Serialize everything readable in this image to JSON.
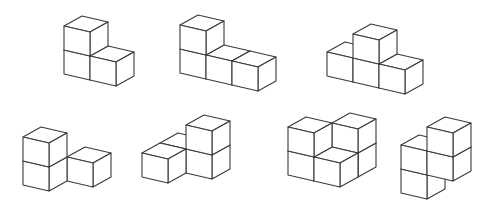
{
  "diagram": {
    "style": {
      "stroke": "#3a3a3a",
      "fill": "#ffffff",
      "background": "#ffffff"
    },
    "projection": {
      "ex": [
        26,
        6
      ],
      "ey": [
        18,
        -10
      ],
      "ez": [
        0,
        -24
      ]
    },
    "figures": [
      {
        "id": "figure-1",
        "origin": [
          64,
          74
        ],
        "cubes": [
          [
            0,
            0,
            0
          ],
          [
            0,
            0,
            1
          ],
          [
            1,
            0,
            0
          ]
        ]
      },
      {
        "id": "figure-2",
        "origin": [
          180,
          73
        ],
        "cubes": [
          [
            0,
            0,
            0
          ],
          [
            0,
            0,
            1
          ],
          [
            1,
            0,
            0
          ],
          [
            2,
            0,
            0
          ]
        ]
      },
      {
        "id": "figure-3",
        "origin": [
          327,
          76
        ],
        "cubes": [
          [
            0,
            0,
            0
          ],
          [
            1,
            0,
            0
          ],
          [
            2,
            0,
            0
          ],
          [
            1,
            0,
            1
          ]
        ]
      },
      {
        "id": "figure-4",
        "origin": [
          23,
          185
        ],
        "cubes": [
          [
            0,
            0,
            0
          ],
          [
            0,
            0,
            1
          ],
          [
            1,
            1,
            0
          ]
        ]
      },
      {
        "id": "figure-5",
        "origin": [
          142,
          177
        ],
        "cubes": [
          [
            0,
            0,
            0
          ],
          [
            0,
            1,
            0
          ],
          [
            1,
            1,
            0
          ],
          [
            1,
            1,
            1
          ]
        ]
      },
      {
        "id": "figure-6",
        "origin": [
          288,
          175
        ],
        "cubes": [
          [
            1,
            1,
            0
          ],
          [
            1,
            1,
            1
          ],
          [
            0,
            0,
            0
          ],
          [
            0,
            0,
            1
          ],
          [
            1,
            0,
            0
          ]
        ]
      },
      {
        "id": "figure-7",
        "origin": [
          401,
          193
        ],
        "cubes": [
          [
            0,
            0,
            0
          ],
          [
            0,
            0,
            1
          ],
          [
            1,
            0,
            1
          ],
          [
            1,
            0,
            2
          ]
        ]
      }
    ]
  }
}
